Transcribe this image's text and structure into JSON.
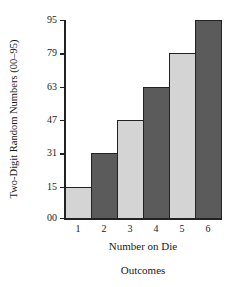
{
  "chart_data": {
    "type": "bar",
    "title": "",
    "subtitle": "Outcomes",
    "xlabel": "Number on Die",
    "ylabel": "Two-Digit Random Numbers (00–95)",
    "categories": [
      "1",
      "2",
      "3",
      "4",
      "5",
      "6"
    ],
    "values": [
      15,
      31,
      47,
      63,
      79,
      95
    ],
    "yticks": [
      "00",
      "15",
      "31",
      "47",
      "63",
      "79",
      "95"
    ],
    "ytick_values": [
      0,
      15,
      31,
      47,
      63,
      79,
      95
    ],
    "ylim": [
      0,
      95
    ],
    "grid": false,
    "legend": null,
    "bar_fills": [
      "light",
      "dark",
      "light",
      "dark",
      "light",
      "dark"
    ]
  }
}
